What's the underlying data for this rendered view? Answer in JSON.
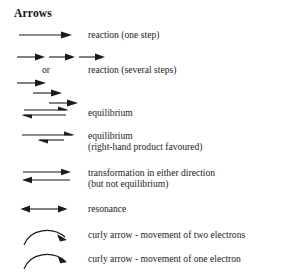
{
  "sheet": {
    "title": "Arrows",
    "background": "#ffffff",
    "ink": "#1a1a1a"
  },
  "or_connector": "or",
  "entries": [
    {
      "glyph": "single-straight-arrow-right",
      "label_line1": "reaction (one step)",
      "label_line2": ""
    },
    {
      "glyph": "three-arrows-in-series-right",
      "label_line1": "",
      "label_line2": ""
    },
    {
      "glyph": "three-arrows-cascading-right",
      "label_line1": "reaction (several steps)",
      "label_line2": ""
    },
    {
      "glyph": "equilibrium-double-half-arrows",
      "label_line1": "equilibrium",
      "label_line2": ""
    },
    {
      "glyph": "equilibrium-unequal-half-arrows",
      "label_line1": "equilibrium",
      "label_line2": "(right-hand product favoured)"
    },
    {
      "glyph": "two-full-arrows-opposite-directions",
      "label_line1": "transformation in either direction",
      "label_line2": "(but not equilibrium)"
    },
    {
      "glyph": "double-headed-resonance-arrow",
      "label_line1": "resonance",
      "label_line2": ""
    },
    {
      "glyph": "curly-arrow-full-head",
      "label_line1": "curly arrow - movement of two electrons",
      "label_line2": ""
    },
    {
      "glyph": "curly-arrow-half-head-fishhook",
      "label_line1": "curly arrow - movement of one electron",
      "label_line2": ""
    }
  ]
}
